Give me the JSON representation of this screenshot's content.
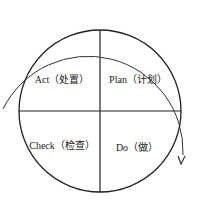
{
  "diagram": {
    "quadrants": [
      {
        "position": "top-left",
        "label": "Act（处置）"
      },
      {
        "position": "top-right",
        "label": "Plan（计划）"
      },
      {
        "position": "bottom-left",
        "label": "Check（检查）"
      },
      {
        "position": "bottom-right",
        "label": "Do（做）"
      }
    ],
    "arrow": {
      "direction": "clockwise",
      "color": "#333333"
    },
    "line_color": "#222222"
  }
}
